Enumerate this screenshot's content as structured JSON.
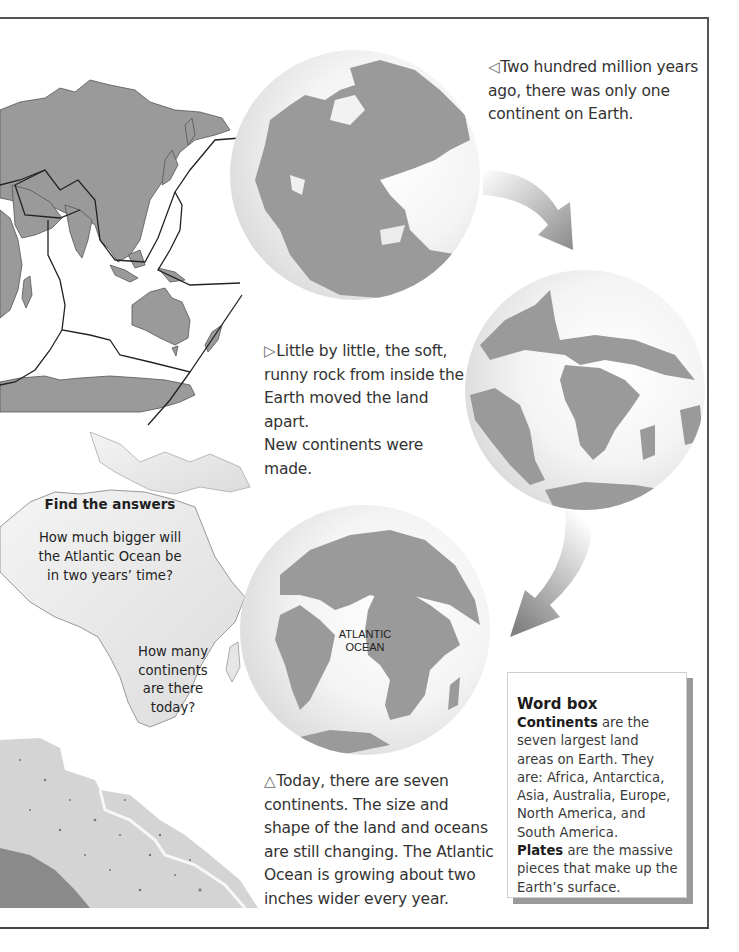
{
  "captions": {
    "past": {
      "marker": "◁",
      "lines": [
        "Two hundred million years",
        "ago, there was only one",
        "continent on Earth."
      ]
    },
    "middle": {
      "marker": "▷",
      "lines": [
        "Little by little, the soft,",
        "runny rock from inside the",
        "Earth moved the land apart.",
        "New continents were made."
      ]
    },
    "today": {
      "marker": "△",
      "lines": [
        "Today, there are seven",
        "continents. The size and",
        "shape of the land and oceans",
        "are still changing. The Atlantic",
        "Ocean is growing about two",
        "inches wider every year."
      ]
    }
  },
  "find_answers": {
    "title": "Find the answers",
    "question1": [
      "How much bigger will",
      "the Atlantic Ocean be",
      "in two years’ time?"
    ],
    "question2": [
      "How many",
      "continents",
      "are there",
      "today?"
    ]
  },
  "globe_labels": {
    "ocean": [
      "ATLANTIC",
      "OCEAN"
    ]
  },
  "word_box": {
    "title": "Word box",
    "entries": [
      {
        "term": "Continents",
        "definition": " are the seven largest land areas on Earth. They are: Africa, Antarctica, Asia, Australia, Europe, North America, and South America."
      },
      {
        "term": "Plates",
        "definition": " are the massive pieces that make up the Earth’s surface."
      }
    ]
  },
  "colors": {
    "land": "#9a9a9a",
    "border": "#555555",
    "text": "#333333",
    "shadow": "#9a9a9a"
  }
}
